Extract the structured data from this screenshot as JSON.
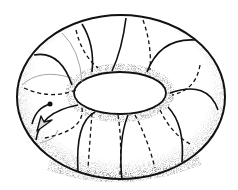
{
  "figure": {
    "colors": {
      "ink": "#111111",
      "faint": "#9a9a9a",
      "background": "#ffffff"
    },
    "elements": {
      "outer_boundary": "torus-outline",
      "inner_hole": "torus-hole",
      "meridians_solid": 9,
      "meridians_dashed": 9,
      "arrow": "arrow-with-dot"
    }
  }
}
